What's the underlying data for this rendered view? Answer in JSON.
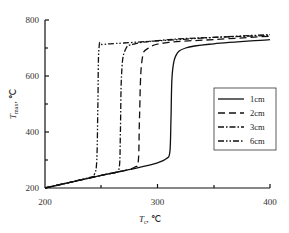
{
  "chart_data": {
    "type": "line",
    "title": "",
    "xlabel": "T_c, ℃",
    "ylabel": "T_max, ℃",
    "xlim": [
      200,
      400
    ],
    "ylim": [
      200,
      800
    ],
    "xticks": [
      200,
      300,
      400
    ],
    "yticks": [
      200,
      400,
      600,
      800
    ],
    "grid": false,
    "legend_position": "right-middle",
    "series": [
      {
        "name": "1cm",
        "style": "solid",
        "x": [
          200,
          250,
          280,
          300,
          308,
          311,
          312,
          313,
          316,
          325,
          350,
          400
        ],
        "y": [
          200,
          245,
          270,
          290,
          305,
          330,
          450,
          600,
          670,
          700,
          715,
          730
        ]
      },
      {
        "name": "2cm",
        "style": "dashed",
        "x": [
          200,
          250,
          270,
          280,
          283,
          284,
          286,
          292,
          310,
          350,
          400
        ],
        "y": [
          200,
          245,
          262,
          275,
          300,
          450,
          650,
          700,
          720,
          730,
          742
        ]
      },
      {
        "name": "3cm",
        "style": "dash-dot",
        "x": [
          200,
          250,
          262,
          266,
          267,
          268,
          271,
          280,
          310,
          350,
          400
        ],
        "y": [
          200,
          245,
          255,
          275,
          400,
          600,
          690,
          715,
          730,
          738,
          745
        ]
      },
      {
        "name": "6cm",
        "style": "dash-dot-dot",
        "x": [
          200,
          240,
          244,
          246,
          247,
          248,
          252,
          270,
          310,
          350,
          400
        ],
        "y": [
          200,
          238,
          250,
          300,
          500,
          700,
          712,
          718,
          728,
          738,
          748
        ]
      }
    ]
  },
  "axes": {
    "x_ticks": [
      "200",
      "300",
      "400"
    ],
    "y_ticks": [
      "200",
      "400",
      "600",
      "800"
    ],
    "x_label_main": "T",
    "x_label_sub": "c",
    "x_label_unit": ",  ℃",
    "y_label_main": "T",
    "y_label_sub": "max",
    "y_label_unit": ",  ℃"
  },
  "legend": {
    "items": [
      "1cm",
      "2cm",
      "3cm",
      "6cm"
    ]
  }
}
